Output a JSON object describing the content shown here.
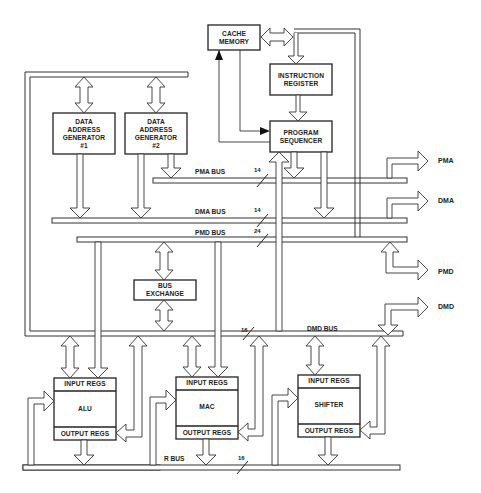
{
  "blocks": {
    "cache_memory": {
      "line1": "CACHE",
      "line2": "MEMORY"
    },
    "instruction_register": {
      "line1": "INSTRUCTION",
      "line2": "REGISTER"
    },
    "program_sequencer": {
      "line1": "PROGRAM",
      "line2": "SEQUENCER"
    },
    "dag1": {
      "line1": "DATA",
      "line2": "ADDRESS",
      "line3": "GENERATOR",
      "line4": "#1"
    },
    "dag2": {
      "line1": "DATA",
      "line2": "ADDRESS",
      "line3": "GENERATOR",
      "line4": "#2"
    },
    "bus_exchange": {
      "line1": "BUS",
      "line2": "EXCHANGE"
    },
    "alu": {
      "input": "INPUT REGS",
      "name": "ALU",
      "output": "OUTPUT REGS"
    },
    "mac": {
      "input": "INPUT REGS",
      "name": "MAC",
      "output": "OUTPUT REGS"
    },
    "shifter": {
      "input": "INPUT REGS",
      "name": "SHIFTER",
      "output": "OUTPUT REGS"
    }
  },
  "buses": {
    "pma": {
      "label": "PMA BUS",
      "width": "14"
    },
    "dma": {
      "label": "DMA BUS",
      "width": "14"
    },
    "pmd": {
      "label": "PMD BUS",
      "width": "24"
    },
    "dmd": {
      "label": "DMD BUS",
      "width": "16"
    },
    "r": {
      "label": "R BUS",
      "width": "16"
    }
  },
  "external": {
    "pma": "PMA",
    "dma": "DMA",
    "pmd": "PMD",
    "dmd": "DMD"
  }
}
